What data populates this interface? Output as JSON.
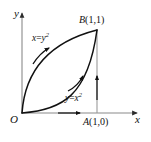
{
  "figure": {
    "background_color": "#ffffff",
    "axis_color": "#8a8a8a",
    "curve_color": "#111111",
    "text_color": "#111111",
    "axes": {
      "x_label": "x",
      "y_label": "y",
      "origin_label": "O"
    },
    "points": [
      {
        "name": "point-b",
        "label_main": "B",
        "label_coords": "(1,1)",
        "x": 1,
        "y": 1
      },
      {
        "name": "point-a",
        "label_main": "A",
        "label_coords": "(1,0)",
        "x": 1,
        "y": 0
      }
    ],
    "curves": [
      {
        "name": "upper-curve",
        "label_lhs": "x",
        "label_eq": "=",
        "label_base": "y",
        "label_exp": "2",
        "equation": "x = y^2",
        "direction": "from O(0,0) toward B(1,1)"
      },
      {
        "name": "lower-curve",
        "label_lhs": "y",
        "label_eq": "=",
        "label_base": "x",
        "label_exp": "2",
        "equation": "y = x^2",
        "direction": "from O(0,0) toward B(1,1)"
      }
    ],
    "segments": [
      {
        "name": "x-axis-segment-oa",
        "description": "arrowed segment along x-axis from O to A(1,0)"
      },
      {
        "name": "vertical-segment-ab",
        "description": "arrowed vertical segment from A(1,0) up to B(1,1)"
      }
    ]
  }
}
